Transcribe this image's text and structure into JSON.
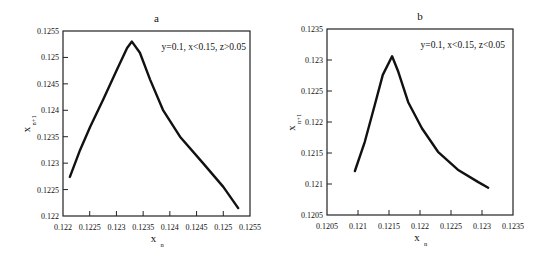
{
  "chart_data": [
    {
      "type": "line",
      "panel": "a",
      "title": "a",
      "annotation": "y=0.1, x<0.15, z>0.05",
      "xlabel": "x",
      "xlabel_sub": "n",
      "ylabel": "x",
      "ylabel_sub": "n+1",
      "xlim": [
        0.122,
        0.1255
      ],
      "ylim": [
        0.122,
        0.1255
      ],
      "xticks": [
        "0.122",
        "0.1225",
        "0.123",
        "0.1235",
        "0.124",
        "0.1245",
        "0.125",
        "0.1255"
      ],
      "yticks": [
        "0.122",
        "0.1225",
        "0.123",
        "0.1235",
        "0.124",
        "0.1245",
        "0.125",
        "0.1255"
      ],
      "grid": false,
      "series": [
        {
          "name": "map",
          "x": [
            0.12213,
            0.12232,
            0.12251,
            0.12275,
            0.12301,
            0.1232,
            0.12329,
            0.12344,
            0.12363,
            0.12387,
            0.12419,
            0.12462,
            0.125,
            0.12528
          ],
          "y": [
            0.12274,
            0.12325,
            0.12369,
            0.1242,
            0.12477,
            0.12518,
            0.1253,
            0.12509,
            0.12458,
            0.12401,
            0.1235,
            0.123,
            0.12255,
            0.12215
          ]
        }
      ]
    },
    {
      "type": "line",
      "panel": "b",
      "title": "b",
      "annotation": "y=0.1, x<0.15, z<0.05",
      "xlabel": "x",
      "xlabel_sub": "n",
      "ylabel": "x",
      "ylabel_sub": "n+1",
      "xlim": [
        0.1205,
        0.1235
      ],
      "ylim": [
        0.1205,
        0.1235
      ],
      "xticks": [
        "0.1205",
        "0.121",
        "0.1215",
        "0.122",
        "0.1225",
        "0.123",
        "0.1235"
      ],
      "yticks": [
        "0.1205",
        "0.121",
        "0.1215",
        "0.122",
        "0.1225",
        "0.123",
        "0.1235"
      ],
      "grid": false,
      "series": [
        {
          "name": "map",
          "x": [
            0.12095,
            0.12111,
            0.12127,
            0.1214,
            0.12155,
            0.12165,
            0.12181,
            0.12203,
            0.12229,
            0.12261,
            0.12294,
            0.1231
          ],
          "y": [
            0.12121,
            0.12168,
            0.12227,
            0.12276,
            0.12306,
            0.12281,
            0.12232,
            0.1219,
            0.12152,
            0.12123,
            0.12103,
            0.12094
          ]
        }
      ]
    }
  ],
  "style": {
    "line_color": "#111111",
    "frame_color": "#222222"
  }
}
